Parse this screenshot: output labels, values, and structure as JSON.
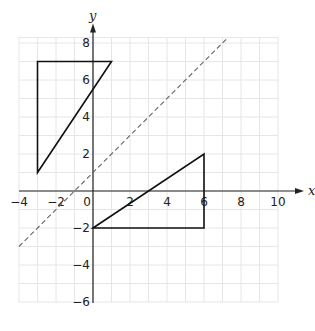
{
  "chart_data": {
    "type": "diagram",
    "title": "",
    "xlabel": "x",
    "ylabel": "y",
    "xlim": [
      -4,
      10
    ],
    "ylim": [
      -6,
      8.3
    ],
    "grid": true,
    "x_ticks": [
      -4,
      -2,
      0,
      2,
      4,
      6,
      8,
      10
    ],
    "y_ticks": [
      -6,
      -4,
      -2,
      2,
      4,
      6,
      8
    ],
    "x_tick_labels": [
      "−4",
      "−2",
      "0",
      "2",
      "4",
      "6",
      "8",
      "10"
    ],
    "y_tick_labels": [
      "−6",
      "−4",
      "−2",
      "2",
      "4",
      "6",
      "8"
    ],
    "shapes": [
      {
        "name": "triangle-upper-left",
        "vertices": [
          [
            -3,
            7
          ],
          [
            1,
            7
          ],
          [
            -3,
            1
          ]
        ]
      },
      {
        "name": "triangle-lower-right",
        "vertices": [
          [
            0,
            -2
          ],
          [
            6,
            2
          ],
          [
            6,
            -2
          ]
        ]
      }
    ],
    "lines": [
      {
        "name": "line-of-reflection",
        "style": "dashed",
        "equation": "y = x + 1",
        "from": [
          -4,
          -3
        ],
        "to": [
          7.2,
          8.2
        ]
      }
    ]
  },
  "colors": {
    "axis": "#222222",
    "grid": "#e6e6e6",
    "shape": "#111111",
    "dashed": "#666666"
  }
}
